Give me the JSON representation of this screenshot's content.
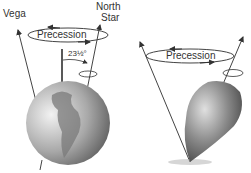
{
  "left_panel": {
    "label_vega": "Vega",
    "label_north_1": "North",
    "label_north_2": "Star",
    "precession_label": "Precession",
    "tilt_label": "23½°"
  },
  "right_panel": {
    "precession_label": "Precession"
  },
  "colors": {
    "line": "#444444",
    "text": "#333333",
    "earth_light": "#e6e6e6",
    "earth_dark": "#6a6a6a",
    "top_light": "#bdbdbd",
    "top_dark": "#4a4a4a"
  }
}
